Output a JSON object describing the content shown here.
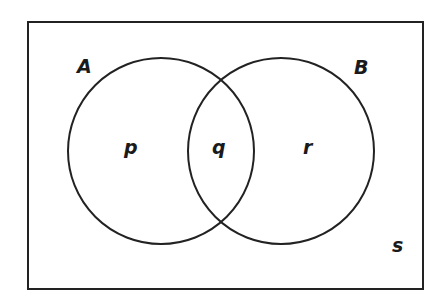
{
  "diagram": {
    "type": "venn",
    "universal_set_label": "s",
    "sets": [
      {
        "label": "A",
        "region_label": "p"
      },
      {
        "label": "B",
        "region_label": "r"
      }
    ],
    "intersection_label": "q",
    "colors": {
      "stroke": "#222222",
      "background": "#ffffff"
    }
  }
}
